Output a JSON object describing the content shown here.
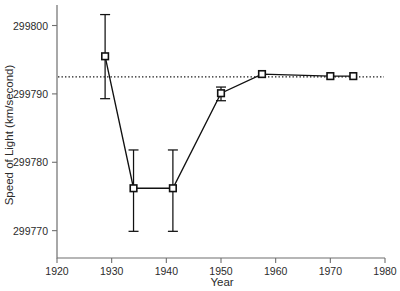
{
  "chart_data": {
    "type": "scatter",
    "title": "",
    "xlabel": "Year",
    "ylabel": "Speed of Light (km/second)",
    "xlim": [
      1920,
      1980
    ],
    "ylim": [
      299766,
      299803
    ],
    "grid": false,
    "legend": null,
    "xticks": [
      1920,
      1930,
      1940,
      1950,
      1960,
      1970,
      1980
    ],
    "xtick_labels": [
      "1920",
      "1930",
      "1940",
      "1950",
      "1960",
      "1970",
      "1980"
    ],
    "yticks": [
      299770,
      299780,
      299790,
      299800
    ],
    "ytick_labels": [
      "299770",
      "299780",
      "299790",
      "299800"
    ],
    "reference_line": {
      "label": "accepted value",
      "orientation": "horizontal",
      "value": 299792.5,
      "style": "dotted"
    },
    "series": [
      {
        "name": "Measured speed of light",
        "marker": "square",
        "line": "solid",
        "x": [
          1928.8,
          1934.0,
          1941.2,
          1950.0,
          1957.5,
          1970.0,
          1974.2
        ],
        "y": [
          299795.5,
          299776.2,
          299776.2,
          299790.1,
          299792.9,
          299792.6,
          299792.6
        ],
        "yerr_low": [
          299789.3,
          299769.9,
          299769.9,
          299789.0,
          299792.9,
          299792.6,
          299792.6
        ],
        "yerr_high": [
          299801.6,
          299781.8,
          299781.8,
          299791.0,
          299792.9,
          299792.6,
          299792.6
        ]
      }
    ]
  },
  "colors": {
    "line": "#111111",
    "axis": "#6f6f6f",
    "text": "#2b2b2b",
    "marker_fill": "#ffffff",
    "background": "#ffffff"
  }
}
